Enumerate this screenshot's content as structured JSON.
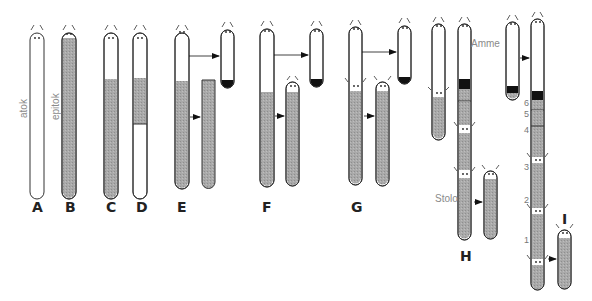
{
  "diagram": {
    "title": "",
    "colors": {
      "outline": "#333333",
      "epitoke_fill": "#a9a9a9",
      "dark_band": "#111111",
      "body_white": "#ffffff",
      "label_text": "#222222",
      "note_text": "#8a8a8a"
    },
    "panel_labels": [
      "A",
      "B",
      "C",
      "D",
      "E",
      "F",
      "G",
      "H",
      "I"
    ],
    "annotations": {
      "atok": "atok",
      "epitok": "epitok",
      "amme": "Amme",
      "stolo": "Stolo"
    },
    "segment_numbers": [
      "6",
      "5",
      "4",
      "3",
      "2",
      "1"
    ]
  }
}
